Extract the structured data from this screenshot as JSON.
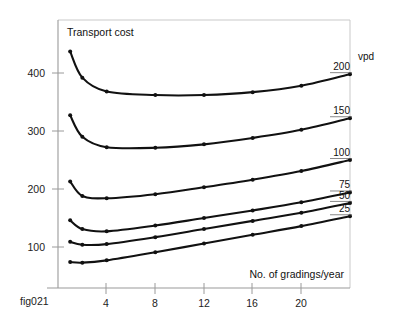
{
  "figure": {
    "caption": "fig021",
    "title": "Transport cost",
    "xlabel": "No. of gradings/year",
    "unit_label": "vpd"
  },
  "chart_data": {
    "type": "line",
    "title": "Transport cost",
    "xlabel": "No. of gradings/year",
    "ylabel": "Transport cost",
    "xlim": [
      0,
      24
    ],
    "ylim": [
      0,
      460
    ],
    "xticks": [
      4,
      8,
      12,
      16,
      20
    ],
    "yticks": [
      100,
      200,
      300,
      400
    ],
    "grid": false,
    "legend_position": "right-inline",
    "legend_title": "vpd",
    "x": [
      1,
      2,
      4,
      8,
      12,
      16,
      20,
      24
    ],
    "series": [
      {
        "name": "200",
        "label": "200",
        "values": [
          437,
          392,
          368,
          362,
          362,
          367,
          378,
          398
        ]
      },
      {
        "name": "150",
        "label": "150",
        "values": [
          327,
          290,
          272,
          271,
          277,
          288,
          302,
          322
        ]
      },
      {
        "name": "100",
        "label": "100",
        "values": [
          213,
          188,
          184,
          191,
          203,
          216,
          231,
          250
        ]
      },
      {
        "name": "75",
        "label": "75",
        "values": [
          146,
          131,
          127,
          137,
          150,
          163,
          177,
          194
        ]
      },
      {
        "name": "50",
        "label": "50",
        "values": [
          109,
          104,
          105,
          117,
          131,
          145,
          159,
          176
        ]
      },
      {
        "name": "25",
        "label": "25",
        "values": [
          74,
          73,
          77,
          91,
          106,
          121,
          136,
          153
        ]
      }
    ]
  }
}
